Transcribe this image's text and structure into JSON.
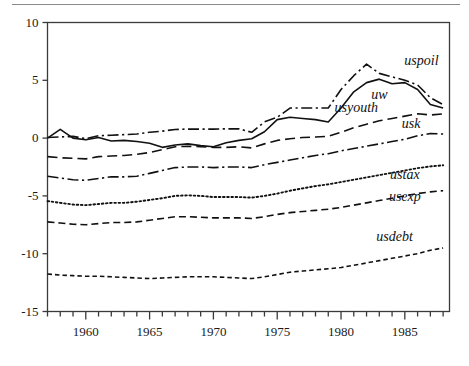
{
  "chart_data": {
    "type": "line",
    "title": "",
    "subtitle": "",
    "xlabel": "",
    "ylabel": "",
    "xlim": [
      1957,
      1988.5
    ],
    "ylim": [
      -15,
      10
    ],
    "yticks": [
      10,
      5,
      0,
      -5,
      -10,
      -15
    ],
    "ytick_labels": [
      "10",
      "5",
      "0",
      "-5",
      "-10",
      "-15"
    ],
    "xticks": [
      1960,
      1965,
      1970,
      1975,
      1980,
      1985
    ],
    "xtick_labels": [
      "1960",
      "1965",
      "1970",
      "1975",
      "1980",
      "1985"
    ],
    "x_minor_tick_interval": 1,
    "grid": false,
    "legend_position": "inline-right-annotations",
    "x": [
      1957,
      1958,
      1959,
      1960,
      1961,
      1962,
      1963,
      1964,
      1965,
      1966,
      1967,
      1968,
      1969,
      1970,
      1971,
      1972,
      1973,
      1974,
      1975,
      1976,
      1977,
      1978,
      1979,
      1980,
      1981,
      1982,
      1983,
      1984,
      1985,
      1986,
      1987,
      1988
    ],
    "series": [
      {
        "name": "uspoil",
        "label": "uspoil",
        "style": "dash-dot",
        "label_x": 1986.3,
        "label_y": 6.6,
        "values": [
          0.05,
          0.1,
          0.15,
          -0.05,
          0.2,
          0.25,
          0.3,
          0.35,
          0.5,
          0.6,
          0.75,
          0.78,
          0.78,
          0.78,
          0.8,
          0.8,
          0.5,
          1.4,
          1.8,
          2.6,
          2.6,
          2.6,
          2.6,
          4.2,
          5.4,
          6.4,
          5.6,
          5.3,
          5.0,
          4.6,
          3.5,
          2.9
        ]
      },
      {
        "name": "uw",
        "label": "uw",
        "style": "solid",
        "label_x": 1983.0,
        "label_y": 3.6,
        "values": [
          0.0,
          0.75,
          0.0,
          -0.15,
          0.05,
          -0.25,
          -0.2,
          -0.3,
          -0.45,
          -0.8,
          -0.6,
          -0.5,
          -0.65,
          -0.75,
          -0.4,
          -0.2,
          -0.05,
          0.55,
          1.6,
          1.8,
          1.7,
          1.6,
          1.4,
          2.6,
          4.0,
          4.8,
          5.1,
          4.7,
          4.8,
          4.2,
          2.9,
          2.6
        ]
      },
      {
        "name": "usyouth",
        "label": "usyouth",
        "style": "dashed-long",
        "label_x": 1981.2,
        "label_y": 2.5,
        "values": [
          -1.6,
          -1.7,
          -1.75,
          -1.8,
          -1.6,
          -1.55,
          -1.5,
          -1.4,
          -1.25,
          -1.0,
          -0.75,
          -0.7,
          -0.75,
          -0.8,
          -0.8,
          -0.75,
          -0.85,
          -0.5,
          -0.2,
          -0.05,
          0.05,
          0.1,
          0.15,
          0.5,
          0.9,
          1.2,
          1.5,
          1.7,
          1.9,
          2.1,
          2.0,
          2.1
        ]
      },
      {
        "name": "usk",
        "label": "usk",
        "style": "dash-dot",
        "label_x": 1985.5,
        "label_y": 1.1,
        "values": [
          -3.3,
          -3.45,
          -3.6,
          -3.65,
          -3.5,
          -3.35,
          -3.35,
          -3.3,
          -3.05,
          -2.8,
          -2.55,
          -2.5,
          -2.5,
          -2.55,
          -2.5,
          -2.5,
          -2.55,
          -2.3,
          -2.1,
          -1.9,
          -1.7,
          -1.5,
          -1.35,
          -1.1,
          -0.9,
          -0.7,
          -0.5,
          -0.3,
          -0.1,
          0.2,
          0.4,
          0.35
        ]
      },
      {
        "name": "ustax",
        "label": "ustax",
        "style": "dotted",
        "label_x": 1985.0,
        "label_y": -3.3,
        "values": [
          -5.45,
          -5.6,
          -5.75,
          -5.8,
          -5.7,
          -5.6,
          -5.6,
          -5.5,
          -5.35,
          -5.2,
          -5.0,
          -4.95,
          -5.0,
          -5.1,
          -5.1,
          -5.1,
          -5.15,
          -5.0,
          -4.8,
          -4.55,
          -4.35,
          -4.15,
          -4.0,
          -3.8,
          -3.6,
          -3.4,
          -3.2,
          -3.0,
          -2.8,
          -2.6,
          -2.45,
          -2.35
        ]
      },
      {
        "name": "usexp",
        "label": "usexp",
        "style": "dashed-medium",
        "label_x": 1985.0,
        "label_y": -5.2,
        "values": [
          -7.25,
          -7.35,
          -7.45,
          -7.5,
          -7.4,
          -7.3,
          -7.3,
          -7.25,
          -7.1,
          -6.95,
          -6.8,
          -6.8,
          -6.85,
          -6.9,
          -6.9,
          -6.9,
          -6.95,
          -6.8,
          -6.6,
          -6.45,
          -6.35,
          -6.25,
          -6.15,
          -6.0,
          -5.8,
          -5.6,
          -5.4,
          -5.2,
          -5.0,
          -4.8,
          -4.65,
          -4.55
        ]
      },
      {
        "name": "usdebt",
        "label": "usdebt",
        "style": "dashed-small",
        "label_x": 1984.2,
        "label_y": -8.6,
        "values": [
          -11.75,
          -11.85,
          -11.9,
          -11.95,
          -11.95,
          -12.0,
          -12.05,
          -12.1,
          -12.15,
          -12.1,
          -12.05,
          -12.0,
          -12.0,
          -12.0,
          -12.05,
          -12.1,
          -12.15,
          -12.0,
          -11.8,
          -11.6,
          -11.5,
          -11.4,
          -11.3,
          -11.2,
          -11.0,
          -10.8,
          -10.6,
          -10.4,
          -10.2,
          -10.0,
          -9.7,
          -9.5
        ]
      }
    ]
  },
  "colors": {
    "line": "#111111",
    "axis": "#3a3a3a",
    "rule": "#8a8a8a",
    "text": "#1a1a1a",
    "background": "#ffffff"
  }
}
